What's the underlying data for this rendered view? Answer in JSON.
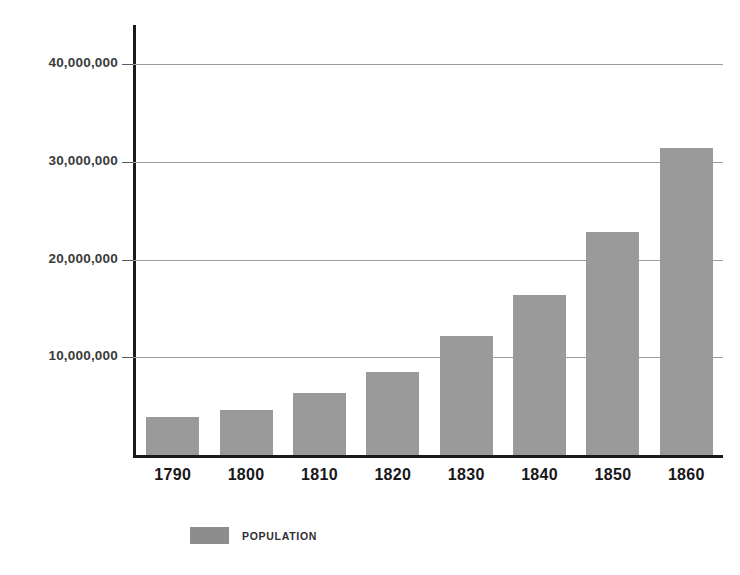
{
  "chart_data": {
    "type": "bar",
    "title": "",
    "subtitle": "",
    "xlabel": "",
    "ylabel": "",
    "categories": [
      "1790",
      "1800",
      "1810",
      "1820",
      "1830",
      "1840",
      "1850",
      "1860"
    ],
    "series": [
      {
        "name": "POPULATION",
        "color": "#9a9a9a",
        "values": [
          3900000,
          4600000,
          6300000,
          8500000,
          12200000,
          16400000,
          22800000,
          31400000
        ]
      }
    ],
    "ylim": [
      0,
      44000000
    ],
    "y_ticks": [
      10000000,
      20000000,
      30000000,
      40000000
    ],
    "y_tick_labels": [
      "10,000,000",
      "20,000,000",
      "30,000,000",
      "40,000,000"
    ],
    "grid": true,
    "legend": {
      "position": "bottom-left",
      "entries": [
        {
          "label": "POPULATION",
          "color": "#8d8d8d"
        }
      ]
    },
    "axis_color": "#1a1a1a",
    "gridline_color": "#9d9d9d",
    "background_color": "#ffffff"
  }
}
